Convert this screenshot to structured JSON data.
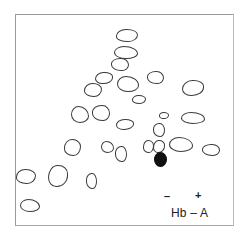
{
  "figure": {
    "type": "peptide-map",
    "label": "Hb – A",
    "polarity": {
      "negative": "–",
      "positive": "+"
    },
    "colors": {
      "outline": "#3a3a3a",
      "highlight": "#111111",
      "frame": "#9a9a9a",
      "background": "#ffffff"
    },
    "spots": [
      {
        "id": 1,
        "cx": 127,
        "cy": 35,
        "w": 22,
        "h": 13,
        "filled": false
      },
      {
        "id": 2,
        "cx": 126,
        "cy": 52,
        "w": 24,
        "h": 13,
        "filled": false
      },
      {
        "id": 3,
        "cx": 120,
        "cy": 64,
        "w": 18,
        "h": 13,
        "filled": false
      },
      {
        "id": 4,
        "cx": 104,
        "cy": 78,
        "w": 18,
        "h": 12,
        "filled": false
      },
      {
        "id": 5,
        "cx": 93,
        "cy": 90,
        "w": 18,
        "h": 14,
        "filled": false
      },
      {
        "id": 6,
        "cx": 128,
        "cy": 84,
        "w": 22,
        "h": 16,
        "filled": false
      },
      {
        "id": 7,
        "cx": 155,
        "cy": 77,
        "w": 17,
        "h": 13,
        "filled": false
      },
      {
        "id": 8,
        "cx": 193,
        "cy": 88,
        "w": 22,
        "h": 16,
        "filled": false
      },
      {
        "id": 9,
        "cx": 139,
        "cy": 99,
        "w": 14,
        "h": 9,
        "filled": false
      },
      {
        "id": 10,
        "cx": 80,
        "cy": 114,
        "w": 18,
        "h": 17,
        "filled": false
      },
      {
        "id": 11,
        "cx": 101,
        "cy": 113,
        "w": 18,
        "h": 16,
        "filled": false
      },
      {
        "id": 12,
        "cx": 125,
        "cy": 124,
        "w": 18,
        "h": 11,
        "filled": false
      },
      {
        "id": 13,
        "cx": 164,
        "cy": 115,
        "w": 10,
        "h": 7,
        "filled": false
      },
      {
        "id": 14,
        "cx": 193,
        "cy": 118,
        "w": 24,
        "h": 12,
        "filled": false
      },
      {
        "id": 15,
        "cx": 159,
        "cy": 130,
        "w": 12,
        "h": 14,
        "filled": false
      },
      {
        "id": 16,
        "cx": 159,
        "cy": 146,
        "w": 12,
        "h": 13,
        "filled": false
      },
      {
        "id": 17,
        "cx": 148,
        "cy": 146,
        "w": 11,
        "h": 13,
        "filled": false
      },
      {
        "id": 18,
        "cx": 181,
        "cy": 144,
        "w": 24,
        "h": 15,
        "filled": false
      },
      {
        "id": 19,
        "cx": 211,
        "cy": 150,
        "w": 18,
        "h": 12,
        "filled": false
      },
      {
        "id": 20,
        "cx": 160,
        "cy": 159,
        "w": 13,
        "h": 15,
        "filled": true
      },
      {
        "id": 21,
        "cx": 72,
        "cy": 147,
        "w": 17,
        "h": 17,
        "filled": false
      },
      {
        "id": 22,
        "cx": 107,
        "cy": 147,
        "w": 13,
        "h": 12,
        "filled": false
      },
      {
        "id": 23,
        "cx": 121,
        "cy": 154,
        "w": 12,
        "h": 16,
        "filled": false
      },
      {
        "id": 24,
        "cx": 58,
        "cy": 176,
        "w": 20,
        "h": 22,
        "filled": false
      },
      {
        "id": 25,
        "cx": 26,
        "cy": 176,
        "w": 20,
        "h": 15,
        "filled": false
      },
      {
        "id": 26,
        "cx": 30,
        "cy": 205,
        "w": 20,
        "h": 13,
        "filled": false
      },
      {
        "id": 27,
        "cx": 91,
        "cy": 181,
        "w": 11,
        "h": 16,
        "filled": false
      }
    ]
  }
}
